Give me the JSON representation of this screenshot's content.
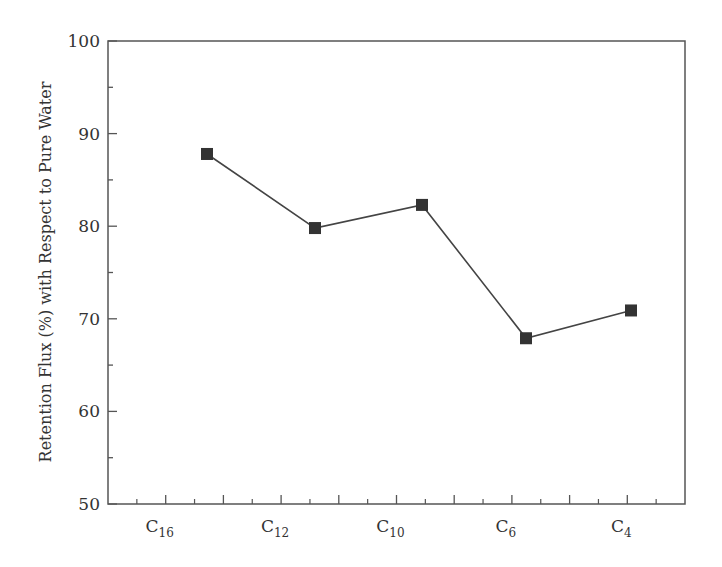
{
  "chart_data": {
    "type": "line",
    "title": "",
    "xlabel": "",
    "ylabel": "Retention Flux (%) with Respect to Pure Water",
    "categories": [
      "C16",
      "C12",
      "C10",
      "C6",
      "C4"
    ],
    "category_labels": [
      {
        "base": "C",
        "sub": "16"
      },
      {
        "base": "C",
        "sub": "12"
      },
      {
        "base": "C",
        "sub": "10"
      },
      {
        "base": "C",
        "sub": "6"
      },
      {
        "base": "C",
        "sub": "4"
      }
    ],
    "series": [
      {
        "name": "Retention Flux",
        "values": [
          87.8,
          79.8,
          82.3,
          67.9,
          70.9
        ],
        "marker": "square",
        "color": "#333333"
      }
    ],
    "ylim": [
      50,
      100
    ],
    "yticks": [
      50,
      60,
      70,
      80,
      90,
      100
    ],
    "grid": false,
    "legend": null
  },
  "colors": {
    "axis": "#555555",
    "line": "#444444",
    "marker": "#333333",
    "text": "#333333"
  }
}
